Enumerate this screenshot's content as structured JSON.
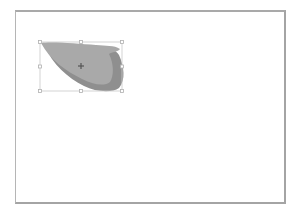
{
  "canvas": {
    "background": "#ffffff",
    "border_color": "#a9a9a9"
  },
  "selected_shape": {
    "type": "freeform-teardrop",
    "fill_color": "#a9a9a9",
    "shadow_color": "#8f8f8f",
    "selection_box": {
      "x": 40,
      "y": 42,
      "width": 82,
      "height": 49
    },
    "selection_color": "#c8c8c8",
    "handles": [
      "top-left",
      "top-center",
      "top-right",
      "middle-left",
      "middle-right",
      "bottom-left",
      "bottom-center",
      "bottom-right"
    ],
    "center_marker": {
      "icon": "crosshair-icon",
      "x": 81,
      "y": 66
    }
  }
}
